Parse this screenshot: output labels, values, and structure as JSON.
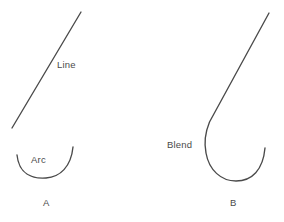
{
  "figure": {
    "stroke_color": "#4a4a4a",
    "background_color": "#ffffff",
    "width": 284,
    "height": 222,
    "panels": [
      {
        "id": "A",
        "letter": "A",
        "description": "Separate straight line and separate upward-opening arc",
        "elements": [
          {
            "name": "line",
            "label": "Line",
            "type": "straight-line",
            "start": [
              12,
              128
            ],
            "end": [
              81,
              12
            ]
          },
          {
            "name": "arc",
            "label": "Arc",
            "type": "arc",
            "start": [
              17,
              155
            ],
            "bottom": [
              45,
              178
            ],
            "end": [
              73,
              147
            ]
          }
        ]
      },
      {
        "id": "B",
        "letter": "B",
        "description": "Straight line blended tangentially into an arc",
        "elements": [
          {
            "name": "blend",
            "label": "Blend",
            "type": "line-to-arc-blend",
            "line_start": [
              269,
              13
            ],
            "tangent_point": [
              208,
              127
            ],
            "bottom": [
              235,
              181
            ],
            "end": [
              265,
              148
            ]
          }
        ]
      }
    ],
    "labels": {
      "line": "Line",
      "arc": "Arc",
      "blend": "Blend",
      "panel_a": "A",
      "panel_b": "B"
    }
  }
}
